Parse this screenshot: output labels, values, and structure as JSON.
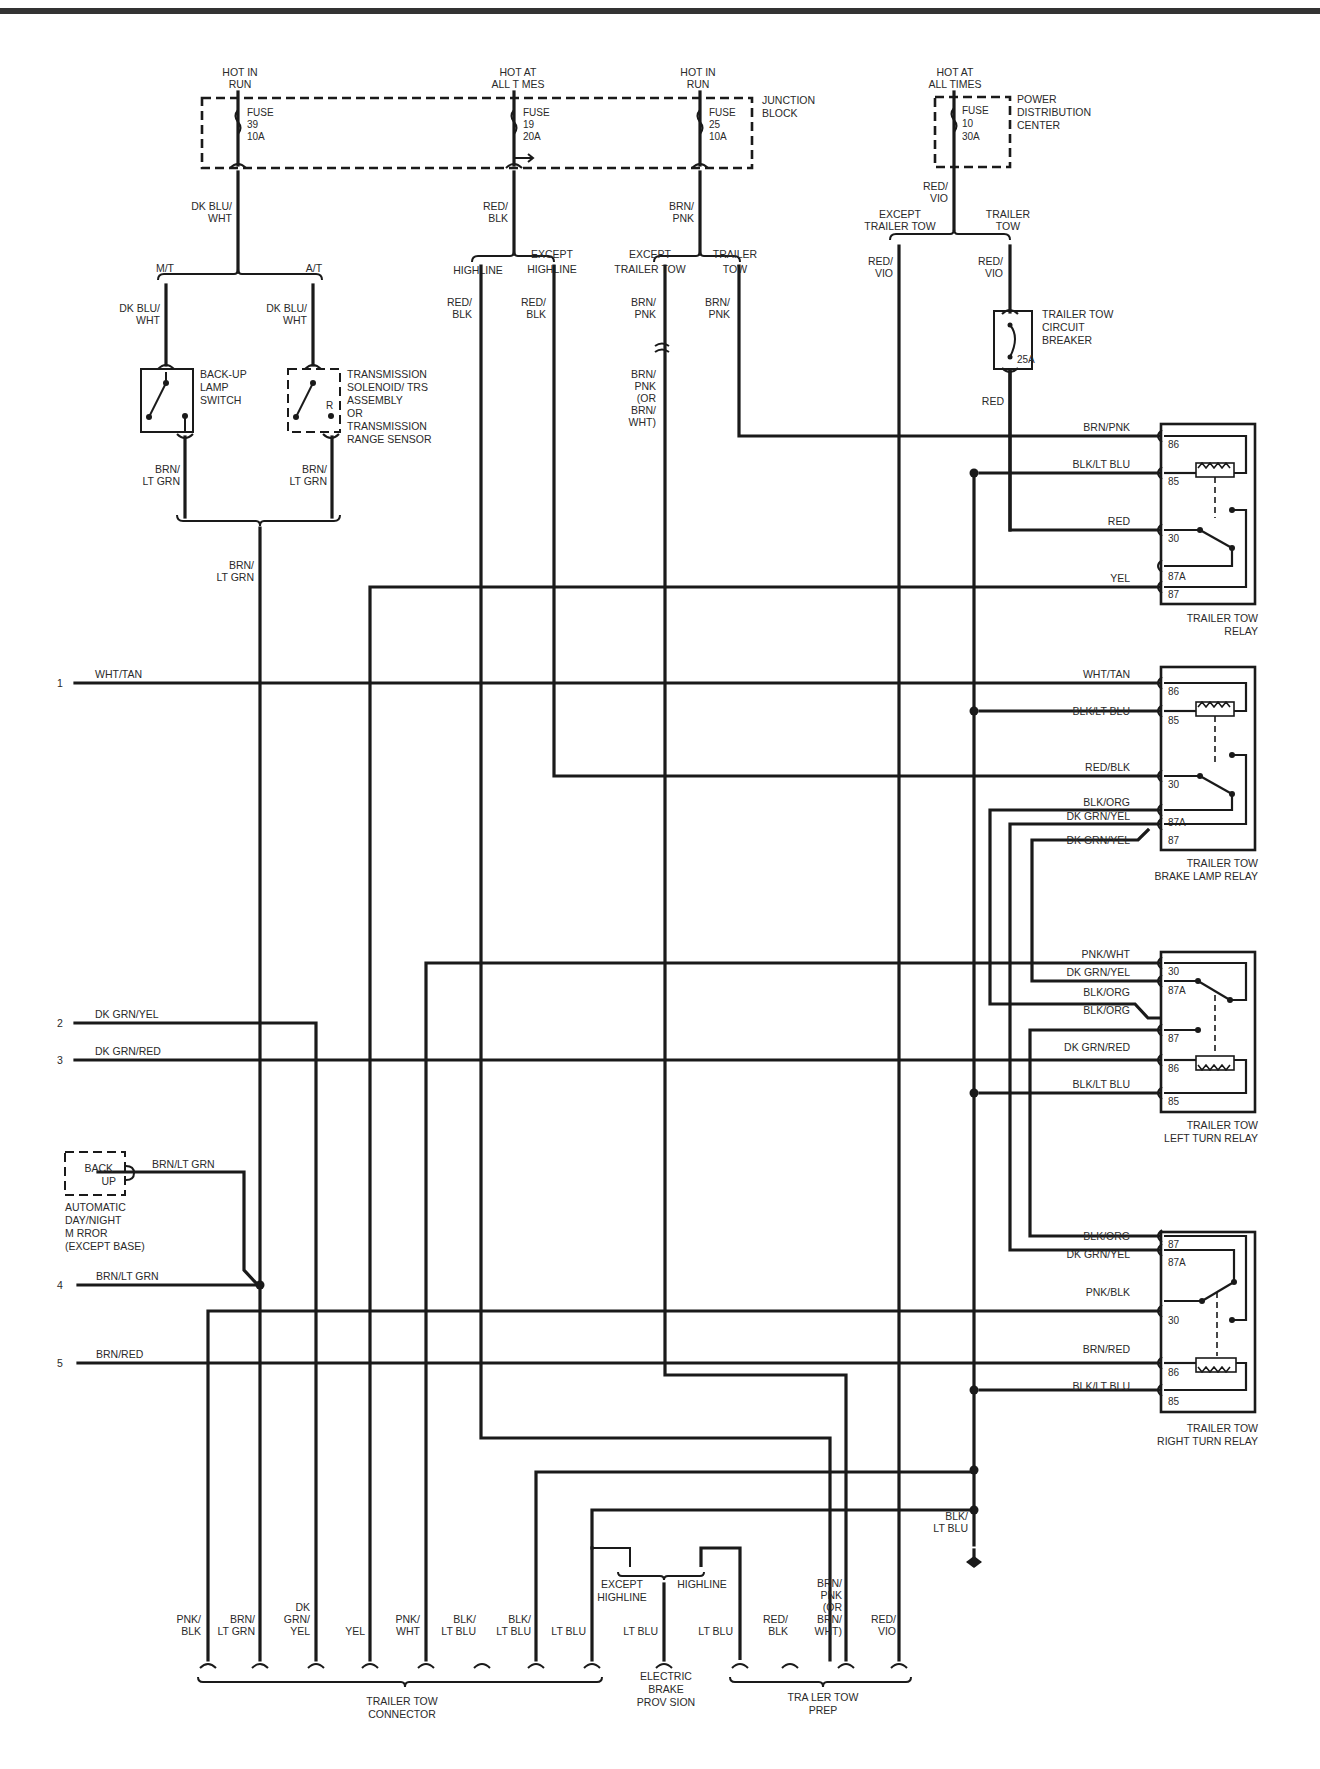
{
  "diagram": {
    "type": "wiring-schematic",
    "colors": {
      "wire": "#1a1a1a",
      "text": "#2a2a2a",
      "background": "#ffffff"
    }
  },
  "fuses": [
    {
      "id": "fuse39",
      "supply": [
        "HOT IN",
        "RUN"
      ],
      "label": "FUSE",
      "number": "39",
      "rating": "10A",
      "wire": [
        "DK BLU/",
        "WHT"
      ]
    },
    {
      "id": "fuse19",
      "supply": [
        "HOT AT",
        "ALL T MES"
      ],
      "label": "FUSE",
      "number": "19",
      "rating": "20A",
      "wire": [
        "RED/",
        "BLK"
      ]
    },
    {
      "id": "fuse25",
      "supply": [
        "HOT IN",
        "RUN"
      ],
      "label": "FUSE",
      "number": "25",
      "rating": "10A",
      "wire": [
        "BRN/",
        "PNK"
      ]
    },
    {
      "id": "fuse10",
      "supply": [
        "HOT AT",
        "ALL TIMES"
      ],
      "label": "FUSE",
      "number": "10",
      "rating": "30A",
      "wire": [
        "RED/",
        "VIO"
      ]
    }
  ],
  "blocks": {
    "junction_block": [
      "JUNCTION",
      "BLOCK"
    ],
    "power_distribution_center": [
      "POWER",
      "DISTRIBUTION",
      "CENTER"
    ]
  },
  "branches": {
    "transmission": {
      "left": "M/T",
      "right": "A/T"
    },
    "highline": {
      "left": "HIGHLINE",
      "right": [
        "EXCEPT",
        "HIGHLINE"
      ]
    },
    "trailer_tow_25": {
      "left": [
        "EXCEPT",
        "TRAILER TOW"
      ],
      "right": [
        "TRAILER",
        "TOW"
      ]
    },
    "trailer_tow_10": {
      "left": [
        "EXCEPT",
        "TRAILER TOW"
      ],
      "right": [
        "TRAILER",
        "TOW"
      ]
    }
  },
  "components": {
    "backup_lamp_switch": [
      "BACK-UP",
      "LAMP",
      "SWITCH"
    ],
    "transmission_sensor": [
      "TRANSMISSION",
      "SOLENOID/ TRS",
      "ASSEMBLY",
      "OR",
      "TRANSMISSION",
      "RANGE SENSOR"
    ],
    "transmission_pin": "R",
    "circuit_breaker": {
      "name": [
        "TRAILER TOW",
        "CIRCUIT",
        "BREAKER"
      ],
      "rating": "25A"
    },
    "mirror": {
      "box": [
        "BACK",
        "UP"
      ],
      "name": [
        "AUTOMATIC",
        "DAY/NIGHT",
        "M RROR",
        "(EXCEPT BASE)"
      ],
      "wire": "BRN/LT GRN"
    }
  },
  "wire_labels": {
    "dk_blu_wht": [
      "DK BLU/",
      "WHT"
    ],
    "red_blk": [
      "RED/",
      "BLK"
    ],
    "brn_pnk": [
      "BRN/",
      "PNK"
    ],
    "brn_pnk_or": [
      "BRN/",
      "PNK",
      "(OR",
      "BRN/",
      "WHT)"
    ],
    "red_vio": [
      "RED/",
      "VIO"
    ],
    "brn_lt_grn": [
      "BRN/",
      "LT GRN"
    ],
    "red": "RED",
    "blk_lt_blu_ground": [
      "BLK/",
      "LT BLU"
    ]
  },
  "relays": [
    {
      "id": "trailer-tow-relay",
      "name": [
        "TRAILER TOW",
        "RELAY"
      ],
      "pins": [
        {
          "wire": "BRN/PNK",
          "pin": "86"
        },
        {
          "wire": "BLK/LT BLU",
          "pin": "85"
        },
        {
          "wire": "RED",
          "pin": "30"
        },
        {
          "wire": "",
          "pin": "87A"
        },
        {
          "wire": "YEL",
          "pin": "87"
        }
      ]
    },
    {
      "id": "brake-lamp-relay",
      "name": [
        "TRAILER TOW",
        "BRAKE LAMP RELAY"
      ],
      "pins": [
        {
          "wire": "WHT/TAN",
          "pin": "86"
        },
        {
          "wire": "BLK/LT BLU",
          "pin": "85"
        },
        {
          "wire": "RED/BLK",
          "pin": "30"
        },
        {
          "wire": "BLK/ORG",
          "pin": "87A"
        },
        {
          "wire": "DK GRN/YEL",
          "pin": "87"
        },
        {
          "wire": "DK GRN/YEL",
          "pin": ""
        }
      ]
    },
    {
      "id": "left-turn-relay",
      "name": [
        "TRAILER TOW",
        "LEFT TURN RELAY"
      ],
      "pins": [
        {
          "wire": "PNK/WHT",
          "pin": "30"
        },
        {
          "wire": "DK GRN/YEL",
          "pin": "87A"
        },
        {
          "wire": "BLK/ORG",
          "pin": ""
        },
        {
          "wire": "BLK/ORG",
          "pin": "87"
        },
        {
          "wire": "DK GRN/RED",
          "pin": "86"
        },
        {
          "wire": "BLK/LT BLU",
          "pin": "85"
        }
      ]
    },
    {
      "id": "right-turn-relay",
      "name": [
        "TRAILER TOW",
        "RIGHT TURN RELAY"
      ],
      "pins": [
        {
          "wire": "BLK/ORG",
          "pin": "87"
        },
        {
          "wire": "DK GRN/YEL",
          "pin": "87A"
        },
        {
          "wire": "PNK/BLK",
          "pin": "30"
        },
        {
          "wire": "BRN/RED",
          "pin": "86"
        },
        {
          "wire": "BLK/LT BLU",
          "pin": "85"
        }
      ]
    }
  ],
  "inputs": [
    {
      "num": "1",
      "wire": "WHT/TAN"
    },
    {
      "num": "2",
      "wire": "DK GRN/YEL"
    },
    {
      "num": "3",
      "wire": "DK GRN/RED"
    },
    {
      "num": "4",
      "wire": "BRN/LT GRN"
    },
    {
      "num": "5",
      "wire": "BRN/RED"
    }
  ],
  "bottom_wires": [
    [
      "PNK/",
      "BLK"
    ],
    [
      "BRN/",
      "LT GRN"
    ],
    [
      "DK",
      "GRN/",
      "YEL"
    ],
    [
      "YEL"
    ],
    [
      "PNK/",
      "WHT"
    ],
    [
      "BLK/",
      "LT BLU"
    ],
    [
      "BLK/",
      "LT BLU"
    ],
    [
      "LT BLU"
    ],
    [
      "LT BLU"
    ],
    [
      "LT BLU"
    ],
    [
      "RED/",
      "BLK"
    ],
    [
      "BRN/",
      "PNK",
      "(OR",
      "BRN/",
      "WHT)"
    ],
    [
      "RED/",
      "VIO"
    ]
  ],
  "electric_brake_branch": {
    "left": [
      "EXCEPT",
      "HIGHLINE"
    ],
    "right": "HIGHLINE"
  },
  "connectors": {
    "trailer_tow_connector": [
      "TRAILER TOW",
      "CONNECTOR"
    ],
    "electric_brake": [
      "ELECTRIC",
      "BRAKE",
      "PROV SION"
    ],
    "trailer_tow_prep": [
      "TRA LER TOW",
      "PREP"
    ]
  }
}
